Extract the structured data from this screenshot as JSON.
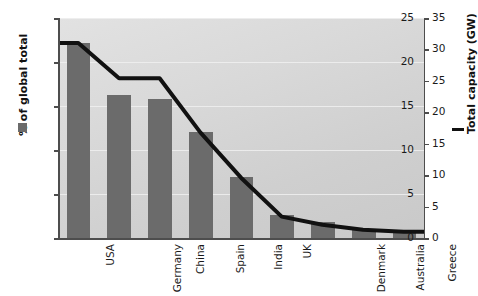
{
  "chart_data": {
    "type": "bar",
    "title": "",
    "categories": [
      "USA",
      "Germany",
      "China",
      "Spain",
      "India",
      "UK",
      "Denmark",
      "Australia",
      "Greece"
    ],
    "series": [
      {
        "name": "% of global total",
        "type": "bar",
        "axis": "left",
        "values": [
          22.2,
          16.3,
          15.8,
          12.1,
          6.9,
          2.6,
          1.8,
          0.9,
          0.7
        ],
        "color": "#6b6b6b"
      },
      {
        "name": "Total capacity (GW)",
        "type": "line",
        "axis": "right",
        "values": [
          31.0,
          25.4,
          25.4,
          16.8,
          9.6,
          3.4,
          2.1,
          1.3,
          1.0
        ],
        "color": "#111111"
      }
    ],
    "left_axis": {
      "label": "% of global total",
      "ticks": [
        "0",
        "5",
        "10",
        "15",
        "20",
        "25"
      ],
      "tick_values": [
        0,
        5,
        10,
        15,
        20,
        25
      ],
      "ylim": [
        0,
        25
      ]
    },
    "right_axis": {
      "label": "Total capacity (GW)",
      "ticks": [
        "0",
        "5",
        "10",
        "15",
        "20",
        "25",
        "30",
        "35"
      ],
      "tick_values": [
        0,
        5,
        10,
        15,
        20,
        25,
        30,
        35
      ],
      "ylim": [
        0,
        35
      ]
    },
    "xlabel": "",
    "grid": true,
    "legend_position": "axis-titles",
    "legend": [
      {
        "label": "% of global total",
        "marker": "square",
        "color": "#6b6b6b"
      },
      {
        "label": "Total capacity (GW)",
        "marker": "line",
        "color": "#111111"
      }
    ],
    "background": "#d8d8d8"
  }
}
